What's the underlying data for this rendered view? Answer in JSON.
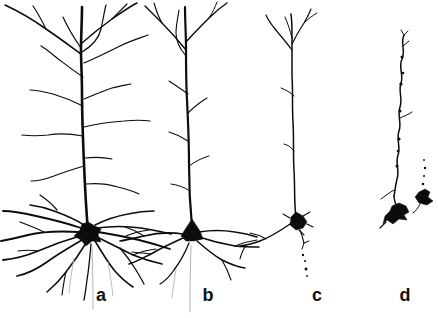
{
  "figure": {
    "background_color": "#ffffff",
    "ink_color": "#0c0c0c",
    "faint_ink_color": "#b4b4b4",
    "neurons": [
      {
        "id": "a",
        "label": "a",
        "strokes": [
          {
            "d": "M88,231 C86,208 85,188 84,164 C83,140 82,116 82,94 C82,76 81,62 81,50 C81,36 82,20 82,7",
            "w": 2.6
          },
          {
            "d": "M81,54 C70,46 58,37 46,29 C32,19 18,11 5,5",
            "w": 1.6
          },
          {
            "d": "M46,29 C42,21 38,13 33,6",
            "w": 1.2
          },
          {
            "d": "M81,48 C74,38 68,28 63,17",
            "w": 1.2
          },
          {
            "d": "M82,43 C91,35 101,27 112,19 C121,13 129,7 137,3",
            "w": 1.5
          },
          {
            "d": "M112,19 C117,14 122,9 127,4",
            "w": 1.1
          },
          {
            "d": "M82,52 C92,46 99,38 101,29 C103,21 104,12 106,5",
            "w": 1.2
          },
          {
            "d": "M84,63 C96,58 108,52 120,46 C130,41 140,38 148,35",
            "w": 1.3
          },
          {
            "d": "M84,99 C94,95 103,91 112,88 C119,86 126,85 131,84",
            "w": 1.2
          },
          {
            "d": "M84,127 C96,124 110,122 124,121 C134,120 143,120 150,121",
            "w": 1.2
          },
          {
            "d": "M85,158 C94,157 103,157 112,159",
            "w": 1.1
          },
          {
            "d": "M86,184 C97,183 108,184 118,187 C126,189 133,191 139,194",
            "w": 1.1
          },
          {
            "d": "M83,77 C74,71 65,64 57,58 C51,53 46,49 41,46",
            "w": 1.2
          },
          {
            "d": "M83,106 C73,101 63,97 53,94 C45,92 37,90 30,90",
            "w": 1.2
          },
          {
            "d": "M83,136 C72,134 60,133 48,135 C39,136 30,136 22,135",
            "w": 1.2
          },
          {
            "d": "M84,166 C74,169 64,172 54,176 C46,179 38,181 31,181",
            "w": 1.1
          },
          {
            "d": "M81,228 C66,223 50,219 36,216 C23,213 11,211 3,211",
            "w": 1.8
          },
          {
            "d": "M79,232 C62,231 44,231 28,235 C16,238 7,240 1,241",
            "w": 1.9
          },
          {
            "d": "M80,236 C66,240 52,245 38,251 C26,256 13,259 3,260",
            "w": 1.8
          },
          {
            "d": "M82,240 C70,247 58,254 47,262 C37,269 27,274 17,276",
            "w": 1.7
          },
          {
            "d": "M86,243 C80,253 73,263 66,272 C60,280 53,287 47,292",
            "w": 1.5
          },
          {
            "d": "M91,244 C90,256 89,268 87,280 C86,288 85,295 84,300",
            "w": 1.3
          },
          {
            "d": "M95,241 C101,251 107,261 114,270 C120,277 127,283 133,287",
            "w": 1.6
          },
          {
            "d": "M97,237 C109,243 121,249 133,255 C143,259 153,262 162,264",
            "w": 1.7
          },
          {
            "d": "M98,232 C112,234 126,237 139,240 C151,243 161,246 170,249",
            "w": 1.8
          },
          {
            "d": "M97,228 C111,226 127,226 141,228 C153,230 163,232 171,234",
            "w": 1.6
          },
          {
            "d": "M95,225 C105,220 117,216 128,214 C137,212 146,211 154,211",
            "w": 1.5
          },
          {
            "d": "M84,225 C75,219 65,215 54,211 C46,208 38,206 30,205",
            "w": 1.5
          },
          {
            "d": "M44,232 C36,228 28,225 20,222",
            "w": 1.3
          },
          {
            "d": "M38,251 C32,250 25,250 18,251",
            "w": 1.2
          },
          {
            "d": "M120,248 C126,255 131,262 136,270 C139,275 142,280 144,284",
            "w": 1.3
          },
          {
            "d": "M126,236 C133,233 141,231 149,230",
            "w": 1.2
          },
          {
            "d": "M66,272 C64,280 63,288 62,295",
            "w": 1.1
          },
          {
            "d": "M57,210 C52,204 46,199 40,195",
            "w": 1.2
          },
          {
            "d": "M133,255 C140,252 148,250 156,249",
            "w": 1.2
          }
        ],
        "faint_strokes": [
          {
            "d": "M92,247 C92,261 93,275 93,289 C93,297 93,303 93,309",
            "w": 1
          },
          {
            "d": "M74,258 C72,270 70,282 69,293",
            "w": 0.9
          },
          {
            "d": "M108,262 C110,274 112,286 113,296",
            "w": 0.9
          }
        ],
        "blobs": [
          "M88,222 L95,226 L101,229 L98,235 L101,242 L92,241 L86,246 L81,240 L74,236 L80,230 L82,224 Z"
        ],
        "dots": []
      },
      {
        "id": "b",
        "label": "b",
        "strokes": [
          {
            "d": "M192,227 C190,206 189,186 189,164 C189,142 188,120 187,100 C186,82 186,64 186,48 C186,34 185,20 185,7",
            "w": 2.2
          },
          {
            "d": "M186,50 C178,40 170,31 162,23 C156,17 150,11 145,6",
            "w": 1.4
          },
          {
            "d": "M162,23 C158,16 156,10 154,3",
            "w": 1.1
          },
          {
            "d": "M186,42 C193,34 201,26 209,18 C215,12 221,7 227,3",
            "w": 1.4
          },
          {
            "d": "M209,18 C213,12 215,7 217,2",
            "w": 1
          },
          {
            "d": "M186,56 C180,49 176,41 176,33 C176,25 178,17 179,10",
            "w": 1.1
          },
          {
            "d": "M188,94 C181,89 175,85 169,81",
            "w": 1.1
          },
          {
            "d": "M188,113 C194,107 200,102 207,98",
            "w": 1.1
          },
          {
            "d": "M188,141 C182,137 176,134 169,132",
            "w": 1.1
          },
          {
            "d": "M189,166 C196,161 202,158 209,156",
            "w": 1
          },
          {
            "d": "M190,191 C184,187 178,185 171,184",
            "w": 1
          },
          {
            "d": "M183,234 C170,232 156,233 144,236 C135,238 127,240 120,241",
            "w": 1.6
          },
          {
            "d": "M183,238 C172,243 161,248 151,254 C143,258 136,262 129,264",
            "w": 1.5
          },
          {
            "d": "M189,243 C185,253 180,262 174,270 C170,276 165,281 160,284",
            "w": 1.3
          },
          {
            "d": "M197,241 C205,248 213,255 222,260 C230,264 238,267 245,268",
            "w": 1.5
          },
          {
            "d": "M199,237 C211,241 223,244 235,246 C244,247 252,247 259,247",
            "w": 1.6
          },
          {
            "d": "M199,232 C211,230 223,230 235,232 C243,233 251,235 257,237",
            "w": 1.4
          },
          {
            "d": "M144,236 C138,232 132,229 125,227",
            "w": 1.2
          },
          {
            "d": "M151,254 C145,253 139,253 132,252",
            "w": 1.1
          },
          {
            "d": "M222,260 C226,267 229,274 231,280",
            "w": 1.1
          },
          {
            "d": "M235,246 C242,243 250,241 257,240",
            "w": 1.1
          }
        ],
        "faint_strokes": [
          {
            "d": "M191,245 C191,259 190,273 190,287 C190,297 190,305 190,312",
            "w": 1
          },
          {
            "d": "M176,270 C174,280 173,290 172,298",
            "w": 0.9
          }
        ],
        "blobs": [
          "M192,219 L200,231 L203,239 L194,241 L186,241 L181,236 L186,228 Z"
        ],
        "dots": []
      },
      {
        "id": "c",
        "label": "c",
        "strokes": [
          {
            "d": "M296,218 C294,202 295,186 294,170 C293,154 294,138 293,122 C292,106 293,90 292,76 C292,62 292,48 292,36 C292,28 292,21 291,14",
            "w": 1.5
          },
          {
            "d": "M292,50 C286,42 280,35 275,29 C271,24 268,20 266,15",
            "w": 1.2
          },
          {
            "d": "M292,44 C296,36 300,29 304,23 C307,18 309,14 311,9",
            "w": 1.2
          },
          {
            "d": "M292,38 C290,30 288,24 285,17",
            "w": 1
          },
          {
            "d": "M304,23 C308,19 312,16 317,13",
            "w": 1
          },
          {
            "d": "M294,96 C290,92 286,90 281,88",
            "w": 1
          },
          {
            "d": "M294,151 C291,147 288,145 284,144",
            "w": 1
          },
          {
            "d": "M290,218 L283,214",
            "w": 1.1
          },
          {
            "d": "M303,216 L310,212",
            "w": 1.1
          },
          {
            "d": "M307,224 L313,227",
            "w": 1.1
          },
          {
            "d": "M299,230 L304,235",
            "w": 1.1
          },
          {
            "d": "M290,224 C280,231 270,237 260,241 C253,244 246,245 240,246",
            "w": 1.4
          },
          {
            "d": "M266,239 C261,236 256,234 250,233",
            "w": 1.1
          },
          {
            "d": "M246,245 C243,250 241,254 240,259",
            "w": 1.1
          },
          {
            "d": "M300,230 C302,235 303,239 304,243",
            "w": 1.1
          },
          {
            "d": "M304,243 L309,241",
            "w": 1
          },
          {
            "d": "M304,243 L302,249",
            "w": 1
          }
        ],
        "faint_strokes": [],
        "blobs": [
          "M296,212 L303,216 L307,222 L303,228 L296,230 L290,225 L291,217 Z"
        ],
        "dots": [
          {
            "x": 303,
            "y": 255,
            "r": 1.2
          },
          {
            "x": 305,
            "y": 261,
            "r": 1.0
          },
          {
            "x": 306,
            "y": 269,
            "r": 1.5
          },
          {
            "x": 307,
            "y": 276,
            "r": 0.9
          }
        ]
      },
      {
        "id": "d",
        "label": "d",
        "strokes": [
          {
            "d": "M404,35 C400,43 406,51 402,59 C398,67 404,75 401,83 C398,91 403,99 400,107 C397,115 402,123 399,131 C396,139 401,147 398,155 C395,163 400,171 397,179 C395,187 395,192 394,196",
            "w": 1.5
          },
          {
            "d": "M404,35 L401,30",
            "w": 1
          },
          {
            "d": "M404,35 L408,31",
            "w": 1
          },
          {
            "d": "M403,46 L409,41",
            "w": 1
          },
          {
            "d": "M400,118 C404,116 408,115 412,112",
            "w": 1
          },
          {
            "d": "M394,190 C389,193 385,196 381,199",
            "w": 1
          },
          {
            "d": "M394,196 C394,199 395,202 396,205",
            "w": 1.4
          },
          {
            "d": "M386,222 L380,228",
            "w": 1.2
          },
          {
            "d": "M420,204 C418,208 416,211 413,213",
            "w": 1
          }
        ],
        "faint_strokes": [],
        "blobs": [
          "M392,206 L399,203 L406,206 L409,212 L404,215 L407,220 L399,219 L393,224 L387,220 L383,224 L385,216 L390,211 Z",
          "M419,192 L425,189 L430,192 L428,197 L433,201 L427,205 L419,203 L415,197 Z"
        ],
        "dots": [
          {
            "x": 402,
            "y": 57,
            "r": 1.5
          },
          {
            "x": 401,
            "y": 84,
            "r": 1.6
          },
          {
            "x": 400,
            "y": 111,
            "r": 1.5
          },
          {
            "x": 399,
            "y": 139,
            "r": 1.6
          },
          {
            "x": 397,
            "y": 166,
            "r": 1.5
          },
          {
            "x": 403,
            "y": 73,
            "r": 1.3
          },
          {
            "x": 398,
            "y": 151,
            "r": 1.3
          },
          {
            "x": 424,
            "y": 160,
            "r": 0.9
          },
          {
            "x": 425,
            "y": 168,
            "r": 1.2
          },
          {
            "x": 424,
            "y": 176,
            "r": 1.0
          },
          {
            "x": 423,
            "y": 184,
            "r": 1.3
          }
        ]
      }
    ]
  }
}
